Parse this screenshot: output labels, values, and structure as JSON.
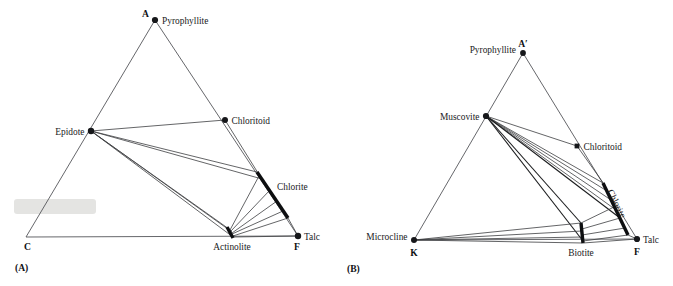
{
  "figure": {
    "panels": [
      {
        "id": "A",
        "panel_label": "(A)",
        "apex_labels": {
          "top": "A",
          "left": "C",
          "right": "F"
        },
        "phases": [
          {
            "name": "Pyrophyllite",
            "marker": "dot",
            "x": 155,
            "y": 20,
            "label_dx": 7,
            "label_dy": 3.5,
            "anchor": "start"
          },
          {
            "name": "Chloritoid",
            "marker": "dot",
            "x": 225,
            "y": 120,
            "label_dx": 6.5,
            "label_dy": 3.5,
            "anchor": "start"
          },
          {
            "name": "Epidote",
            "marker": "dot",
            "x": 91,
            "y": 131,
            "label_dx": -6.5,
            "label_dy": 3.5,
            "anchor": "end"
          },
          {
            "name": "Chlorite",
            "marker": "bar",
            "x": 257,
            "y": 172,
            "x2": 288,
            "y2": 218,
            "label_dx": 9,
            "label_dy": 9,
            "anchor": "start"
          },
          {
            "name": "Actinolite",
            "marker": "bar",
            "x": 227,
            "y": 227,
            "x2": 233,
            "y2": 238,
            "label_dx": -2,
            "label_dy": 13,
            "anchor": "middle"
          },
          {
            "name": "Talc",
            "marker": "dot",
            "x": 298,
            "y": 236,
            "label_dx": 6.5,
            "label_dy": 3.5,
            "anchor": "start"
          }
        ]
      },
      {
        "id": "B",
        "panel_label": "(B)",
        "apex_labels": {
          "top": "A′",
          "left": "K",
          "right": "F"
        },
        "phases": [
          {
            "name": "Pyrophyllite",
            "marker": "dot",
            "x": 523,
            "y": 53,
            "label_dx": -7,
            "label_dy": 0,
            "anchor": "end"
          },
          {
            "name": "Muscovite",
            "marker": "dot",
            "x": 486,
            "y": 116,
            "label_dx": -6.5,
            "label_dy": 3.5,
            "anchor": "end"
          },
          {
            "name": "Chloritoid",
            "marker": "dot",
            "x": 577,
            "y": 146,
            "label_dx": 6.5,
            "label_dy": 3.5,
            "anchor": "start"
          },
          {
            "name": "Chlorite",
            "marker": "bar",
            "x": 603,
            "y": 183,
            "x2": 628,
            "y2": 235,
            "label_dx": 0,
            "label_dy": 0,
            "anchor": "rotated"
          },
          {
            "name": "Microcline",
            "marker": "dot",
            "x": 414,
            "y": 240,
            "label_dx": -6.5,
            "label_dy": 0,
            "anchor": "end"
          },
          {
            "name": "Biotite",
            "marker": "bar",
            "x": 581,
            "y": 223,
            "x2": 583,
            "y2": 243,
            "label_dx": -2,
            "label_dy": 13,
            "anchor": "middle"
          },
          {
            "name": "Talc",
            "marker": "dot",
            "x": 637,
            "y": 239,
            "label_dx": 6.5,
            "label_dy": 3.5,
            "anchor": "start"
          }
        ]
      }
    ],
    "colors": {
      "edge": "#55565a",
      "tie": "#3c3d40",
      "marker": "#16171a",
      "text": "#1a1b1d",
      "background": "#ffffff",
      "smudge": "#e2e2e0"
    }
  }
}
